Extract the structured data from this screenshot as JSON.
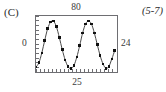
{
  "panel": {
    "label": "(C)",
    "reference": "(5-7)"
  },
  "axes": {
    "top_label": "80",
    "bottom_label": "25",
    "left_label": "0",
    "right_label": "24"
  },
  "style": {
    "frame_color": "#6e6e72",
    "curve_color": "#4a4a4a",
    "marker_color": "#111111",
    "text_color": "#2b2b2b",
    "background": "#ffffff"
  },
  "chart_data": {
    "type": "line",
    "title": "",
    "xlabel": "25",
    "ylabel": "0",
    "x_top_label": "80",
    "y_right_label": "24",
    "grid": false,
    "legend": null,
    "xlim": [
      0,
      25
    ],
    "ylim": [
      0,
      24
    ],
    "x_ticks": [
      0,
      1.25,
      2.5,
      3.75,
      5,
      6.25,
      7.5,
      8.75,
      10,
      11.25,
      12.5,
      13.75,
      15,
      16.25,
      17.5,
      18.75,
      20,
      21.25,
      22.5,
      23.75,
      25
    ],
    "y_ticks": [
      0,
      2,
      4,
      6,
      8,
      10,
      12,
      14,
      16,
      18,
      20,
      22,
      24
    ],
    "series": [
      {
        "name": "sinusoid",
        "marker": "filled-square",
        "x": [
          0.0,
          0.9,
          1.8,
          2.7,
          3.6,
          4.5,
          5.4,
          6.3,
          7.2,
          8.1,
          9.0,
          9.9,
          10.8,
          11.7,
          12.6,
          13.5,
          14.4,
          15.3,
          16.2,
          17.1,
          18.0,
          18.9,
          19.8,
          20.7,
          21.6,
          22.5,
          23.4,
          24.3
        ],
        "y": [
          2.1,
          4.0,
          8.2,
          13.6,
          18.6,
          21.4,
          21.8,
          19.4,
          14.8,
          9.6,
          5.2,
          2.3,
          1.4,
          2.8,
          6.4,
          11.4,
          16.8,
          20.6,
          21.9,
          20.6,
          16.8,
          11.8,
          7.0,
          3.4,
          1.6,
          2.4,
          5.6,
          9.2
        ]
      }
    ],
    "annotations": []
  }
}
